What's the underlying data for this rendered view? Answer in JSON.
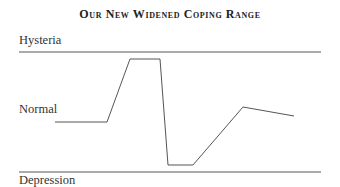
{
  "title": "Our New Widened Coping Range",
  "labels": {
    "top": "Hysteria",
    "middle": "Normal",
    "bottom": "Depression"
  },
  "colors": {
    "line": "#444444",
    "text": "#333333"
  },
  "chart_data": {
    "type": "line",
    "title": "Our New Widened Coping Range",
    "ylabels": [
      "Hysteria",
      "Normal",
      "Depression"
    ],
    "points_px": [
      [
        55,
        122
      ],
      [
        107,
        122
      ],
      [
        130,
        59
      ],
      [
        160,
        59
      ],
      [
        168,
        165
      ],
      [
        193,
        165
      ],
      [
        243,
        107
      ],
      [
        294,
        116
      ]
    ],
    "reference_lines": [
      {
        "name": "Hysteria",
        "y": 52
      },
      {
        "name": "Depression",
        "y": 172
      }
    ]
  }
}
